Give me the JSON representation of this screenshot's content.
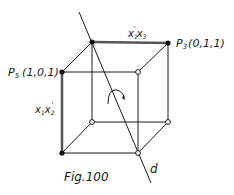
{
  "figure": {
    "caption": "Fig.100",
    "line_label": "d",
    "vertices": {
      "p3": {
        "name": "P",
        "sub": "3",
        "coords": "(0,1,1)"
      },
      "p5": {
        "name": "P",
        "sub": "5",
        "coords": "(1,0,1)"
      }
    },
    "edge_labels": {
      "top": {
        "a": "x",
        "a_sub": "1",
        "a_prime": "'",
        "b": "x",
        "b_sub": "3"
      },
      "left": {
        "a": "x",
        "a_sub": "1",
        "b": "x",
        "b_sub": "2",
        "b_prime": "'"
      }
    },
    "colors": {
      "ink": "#1a1a1a",
      "thick_edge": "#555555",
      "background": "#ffffff"
    }
  }
}
